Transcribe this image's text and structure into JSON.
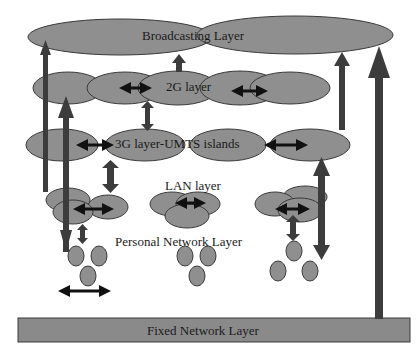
{
  "diagram": {
    "layers": {
      "broadcasting": "Broadcasting Layer",
      "g2": "2G layer",
      "g3": "3G layer-UMTS islands",
      "lan": "LAN layer",
      "personal": "Personal Network Layer",
      "fixed": "Fixed Network Layer"
    },
    "colors": {
      "ellipse_fill": "#8f8f8f",
      "ellipse_stroke": "#3a3a3a",
      "arrow_fill": "#3c3c3c",
      "double_arrow": "#111111",
      "fixed_bar": "#8a8a8a",
      "background": "#ffffff"
    }
  }
}
